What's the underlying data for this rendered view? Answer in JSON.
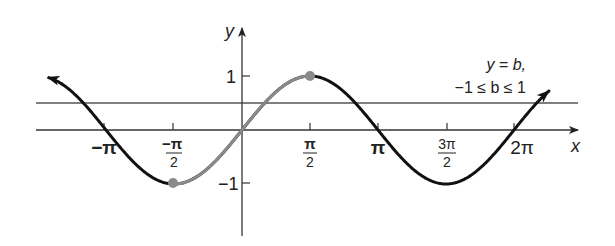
{
  "chart_data": {
    "type": "line",
    "title": "",
    "function": "y = sin x",
    "xlabel": "x",
    "ylabel": "y",
    "xlim": [
      -4.6,
      7.2
    ],
    "ylim": [
      -1.6,
      1.5
    ],
    "grid": false,
    "x_ticks": [
      {
        "value": -3.14159,
        "label": "−π",
        "kind": "plain"
      },
      {
        "value": -1.5708,
        "label_num": "−π",
        "label_den": "2",
        "kind": "fraction"
      },
      {
        "value": 1.5708,
        "label_num": "π",
        "label_den": "2",
        "kind": "fraction"
      },
      {
        "value": 3.14159,
        "label": "π",
        "kind": "plain"
      },
      {
        "value": 4.71239,
        "label_num": "3π",
        "label_den": "2",
        "kind": "fraction"
      },
      {
        "value": 6.28319,
        "label": "2π",
        "kind": "plain"
      }
    ],
    "y_ticks": [
      {
        "value": 1,
        "label": "1"
      },
      {
        "value": -1,
        "label": "−1"
      }
    ],
    "series": [
      {
        "name": "sin x (outside restricted domain)",
        "color": "#111111",
        "x_range": [
          -4.5,
          7.1
        ],
        "style": "solid",
        "arrows": "both ends"
      },
      {
        "name": "sin x on [−π/2, π/2] (restricted)",
        "color": "#8a8a8a",
        "x_range": [
          -1.5708,
          1.5708
        ],
        "style": "solid"
      }
    ],
    "points": [
      {
        "x": -1.5708,
        "y": -1,
        "label": "(−π/2, −1)",
        "color": "#8a8a8a"
      },
      {
        "x": 1.5708,
        "y": 1,
        "label": "(π/2, 1)",
        "color": "#8a8a8a"
      }
    ],
    "horizontal_line": {
      "y": 0.5,
      "label_line1": "y = b,",
      "label_line2": "−1 ≤ b ≤ 1",
      "color": "#555555"
    },
    "annotations": [
      "y = b,",
      "−1 ≤ b ≤ 1"
    ]
  },
  "labels": {
    "x_axis": "x",
    "y_axis": "y",
    "tick_neg_pi": "−π",
    "tick_neg_half_pi_num": "−π",
    "tick_neg_half_pi_den": "2",
    "tick_half_pi_num": "π",
    "tick_half_pi_den": "2",
    "tick_pi": "π",
    "tick_three_half_pi_num": "3π",
    "tick_three_half_pi_den": "2",
    "tick_two_pi": "2π",
    "ytick_1": "1",
    "ytick_neg1": "−1",
    "hline_line1": "y = b,",
    "hline_line2": "−1 ≤ b ≤ 1"
  }
}
